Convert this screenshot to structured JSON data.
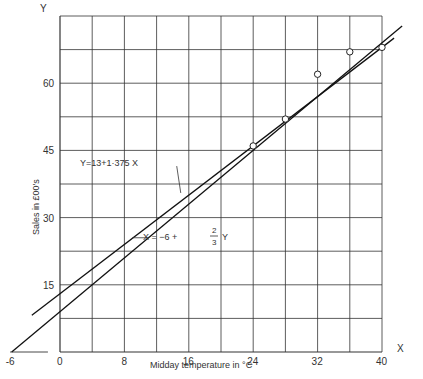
{
  "chart_data": {
    "type": "scatter",
    "title": "",
    "xlabel": "Midday temperature in °C",
    "ylabel": "Sales in £00's",
    "x_axis_letter": "X",
    "y_axis_letter": "Y",
    "xlim": [
      -6,
      40
    ],
    "ylim": [
      0,
      75
    ],
    "x_ticks": [
      "-6",
      "0",
      "8",
      "16",
      "24",
      "32",
      "40"
    ],
    "y_ticks": [
      "15",
      "30",
      "45",
      "60"
    ],
    "grid": true,
    "points": [
      {
        "x": 24,
        "y": 46
      },
      {
        "x": 28,
        "y": 52
      },
      {
        "x": 32,
        "y": 62
      },
      {
        "x": 36,
        "y": 67
      },
      {
        "x": 40,
        "y": 68
      }
    ],
    "series": [
      {
        "name": "Y = 13 + 1·375 X",
        "label": "Y=13+1·375 X",
        "type": "line",
        "intercept": 13,
        "slope": 1.375
      },
      {
        "name": "X = -6 + 2/3 Y",
        "label_prefix": "X = −6 + ",
        "num": "2",
        "den": "3",
        "label_suffix": "Y",
        "type": "line",
        "x_intercept": -6,
        "slope_x_per_y": 0.6667
      }
    ]
  }
}
